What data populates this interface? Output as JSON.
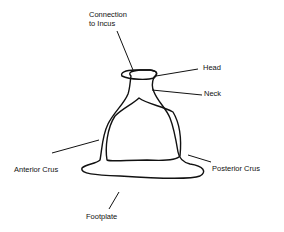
{
  "diagram": {
    "labels": {
      "connection_line1": "Connection",
      "connection_line2": "to Incus",
      "head": "Head",
      "neck": "Neck",
      "anterior_crus": "Anterior Crus",
      "posterior_crus": "Posterior Crus",
      "footplate": "Footplate"
    }
  }
}
